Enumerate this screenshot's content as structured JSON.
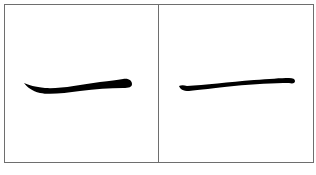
{
  "figure": {
    "panels": [
      {
        "id": "left",
        "glyph": "一",
        "description": "bold calligraphic horizontal stroke (heng) with rounded end",
        "stroke_color": "#000000"
      },
      {
        "id": "right",
        "glyph": "一",
        "description": "thin calligraphic horizontal stroke (heng)",
        "stroke_color": "#000000"
      }
    ],
    "frame_color": "#6e6e6e",
    "background": "#ffffff"
  }
}
